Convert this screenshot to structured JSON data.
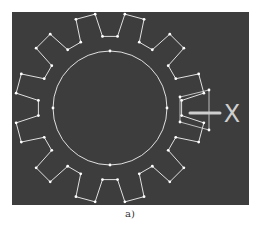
{
  "figure": {
    "caption": "a)",
    "background_color": "#3d3d3d",
    "line_color": "#e0e0e0",
    "axis_label": "X",
    "gear": {
      "center": [
        110,
        108
      ],
      "inner_circle_radius": 57,
      "root_radius": 72,
      "tip_radius": 95,
      "tooth_count": 12,
      "tooth_half_angle_deg": 9,
      "tip_half_angle_deg": 6,
      "rotation_deg": 0
    },
    "highlight_box": {
      "points": [
        [
          180,
          97
        ],
        [
          209,
          90
        ],
        [
          209,
          130
        ],
        [
          180,
          122
        ]
      ]
    },
    "marker_line": {
      "from": [
        190,
        113
      ],
      "to": [
        220,
        113
      ]
    }
  }
}
